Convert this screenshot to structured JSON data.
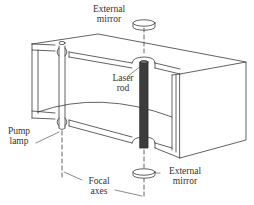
{
  "figure": {
    "labels": {
      "external_mirror_top_line1": "External",
      "external_mirror_top_line2": "mirror",
      "laser_rod_line1": "Laser",
      "laser_rod_line2": "rod",
      "pump_lamp_line1": "Pump",
      "pump_lamp_line2": "lamp",
      "focal_axes_line1": "Focal",
      "focal_axes_line2": "axes",
      "external_mirror_bottom_line1": "External",
      "external_mirror_bottom_line2": "mirror"
    },
    "colors": {
      "line": "#3a3a3a",
      "rod_fill": "#3c3c3c",
      "background": "#ffffff"
    }
  }
}
